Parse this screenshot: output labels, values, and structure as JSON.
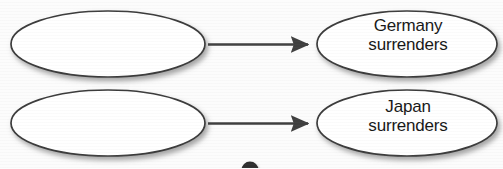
{
  "diagram": {
    "type": "flowchart",
    "orientation": "left-to-right",
    "background_color": "#fcfcfc",
    "outline_color": "#3b3b3b",
    "node_fill_color": "#ffffff",
    "arrow_color": "#3f3f3f",
    "text_color": "#171717",
    "rows": [
      {
        "row_name": "germany-row",
        "cause": {
          "shape": "ellipse",
          "label": "",
          "filled_in": false
        },
        "connector": {
          "shape": "arrow",
          "direction": "right",
          "label": ""
        },
        "effect": {
          "shape": "ellipse",
          "label": "Germany\nsurrenders",
          "line_1": "Germany",
          "line_2": "surrenders",
          "filled_in": true
        }
      },
      {
        "row_name": "japan-row",
        "cause": {
          "shape": "ellipse",
          "label": "",
          "filled_in": false
        },
        "connector": {
          "shape": "arrow",
          "direction": "right",
          "label": ""
        },
        "effect": {
          "shape": "ellipse",
          "label": "Japan\nsurrenders",
          "line_1": "Japan",
          "line_2": "surrenders",
          "filled_in": true
        }
      }
    ],
    "page_marker": {
      "shape": "circle",
      "label": "",
      "cropped": true
    }
  }
}
